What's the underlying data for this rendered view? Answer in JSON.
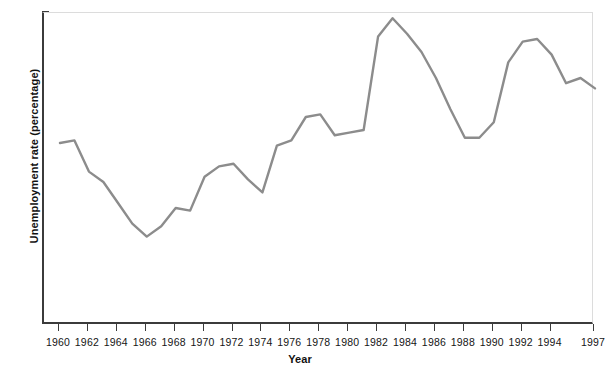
{
  "chart_data": {
    "type": "line",
    "title": "",
    "xlabel": "Year",
    "ylabel": "Unemployment rate (percentage)",
    "xlim": [
      1960,
      1997
    ],
    "ylim": [
      0.0,
      12.0
    ],
    "grid": false,
    "legend": "none",
    "line_color": "#8c8c8c",
    "axis_color": "#3b3b3b",
    "frame_color": "#dcdcdc",
    "ytick_labels": [
      "0.0",
      "2.0",
      "4.0",
      "6.0",
      "8.0",
      "10.0",
      "12.0"
    ],
    "ytick_values": [
      0.0,
      2.0,
      4.0,
      6.0,
      8.0,
      10.0,
      12.0
    ],
    "xtick_labels": [
      "1960",
      "1962",
      "1964",
      "1966",
      "1968",
      "1970",
      "1972",
      "1974",
      "1976",
      "1978",
      "1980",
      "1982",
      "1984",
      "1986",
      "1988",
      "1990",
      "1992",
      "1994",
      "1997"
    ],
    "xtick_values": [
      1960,
      1962,
      1964,
      1966,
      1968,
      1970,
      1972,
      1974,
      1976,
      1978,
      1980,
      1982,
      1984,
      1986,
      1988,
      1990,
      1992,
      1994,
      1997
    ],
    "x": [
      1960,
      1961,
      1962,
      1963,
      1964,
      1965,
      1966,
      1967,
      1968,
      1969,
      1970,
      1971,
      1972,
      1973,
      1974,
      1975,
      1976,
      1977,
      1978,
      1979,
      1980,
      1981,
      1982,
      1983,
      1984,
      1985,
      1986,
      1987,
      1988,
      1989,
      1990,
      1991,
      1992,
      1993,
      1994,
      1995,
      1996,
      1997
    ],
    "values": [
      7.0,
      7.1,
      5.9,
      5.5,
      4.7,
      3.9,
      3.4,
      3.8,
      4.5,
      4.4,
      5.7,
      6.1,
      6.2,
      5.6,
      5.1,
      6.9,
      7.1,
      8.0,
      8.1,
      7.3,
      7.4,
      7.5,
      11.1,
      11.8,
      11.2,
      10.5,
      9.5,
      8.3,
      7.2,
      7.2,
      7.8,
      10.1,
      10.9,
      11.0,
      10.4,
      9.3,
      9.5,
      9.1
    ],
    "series_name": "Unemployment rate"
  }
}
